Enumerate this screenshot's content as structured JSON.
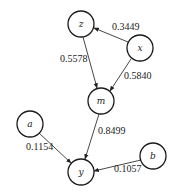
{
  "diagram": {
    "nodes": [
      {
        "id": "z",
        "label": "z",
        "cx": 81,
        "cy": 24
      },
      {
        "id": "x",
        "label": "x",
        "cx": 140,
        "cy": 48
      },
      {
        "id": "m",
        "label": "m",
        "cx": 101,
        "cy": 101
      },
      {
        "id": "a",
        "label": "a",
        "cx": 30,
        "cy": 124
      },
      {
        "id": "y",
        "label": "y",
        "cx": 81,
        "cy": 172
      },
      {
        "id": "b",
        "label": "b",
        "cx": 153,
        "cy": 156
      }
    ],
    "edges": [
      {
        "from": "x",
        "to": "z",
        "weight": "0.3449"
      },
      {
        "from": "z",
        "to": "m",
        "weight": "0.5578"
      },
      {
        "from": "x",
        "to": "m",
        "weight": "0.5840"
      },
      {
        "from": "m",
        "to": "y",
        "weight": "0.8499"
      },
      {
        "from": "a",
        "to": "y",
        "weight": "0.1154"
      },
      {
        "from": "b",
        "to": "y",
        "weight": "0.1057"
      }
    ]
  }
}
